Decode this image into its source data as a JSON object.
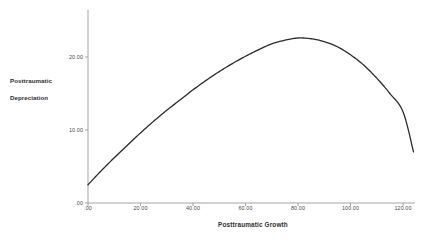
{
  "figure": {
    "background_color": "#ffffff",
    "axis_color": "#9b9b9b",
    "curve_color": "#2b2b2b",
    "text_color": "#3a3a3a"
  },
  "axes": {
    "y_title_line1": "Posttraumatic",
    "y_title_line2": "Depreciation",
    "x_title": "Posttraumatic Growth",
    "x_tick_labels": [
      ".00",
      "20.00",
      "40.00",
      "60.00",
      "80.00",
      "100.00",
      "120.00"
    ],
    "y_tick_labels": [
      ".00",
      "10.00",
      "20.00"
    ]
  },
  "chart_data": {
    "type": "line",
    "title": "",
    "subtitle": "",
    "xlabel": "Posttraumatic Growth",
    "ylabel": "Posttraumatic Depreciation",
    "xlim": [
      0,
      125
    ],
    "ylim": [
      0,
      27.8
    ],
    "xticks": [
      0,
      20,
      40,
      60,
      80,
      100,
      120
    ],
    "yticks": [
      0,
      10,
      20
    ],
    "xtick_labels": [
      ".00",
      "20.00",
      "40.00",
      "60.00",
      "80.00",
      "100.00",
      "120.00"
    ],
    "ytick_labels": [
      ".00",
      "10.00",
      "20.00"
    ],
    "grid": false,
    "legend": false,
    "legend_position": "none",
    "series": [
      {
        "name": "Posttraumatic Depreciation",
        "shape": "inverted-quadratic",
        "color": "#2b2b2b",
        "line_width": 1.3,
        "x": [
          0,
          5,
          10,
          15,
          20,
          25,
          30,
          35,
          40,
          45,
          50,
          55,
          60,
          65,
          70,
          75,
          80,
          85,
          90,
          95,
          100,
          105,
          110,
          115,
          120,
          124
        ],
        "y": [
          2.5,
          4.4,
          6.2,
          7.9,
          9.6,
          11.2,
          12.7,
          14.1,
          15.5,
          16.8,
          18.0,
          19.1,
          20.1,
          21.0,
          21.8,
          22.3,
          22.6,
          22.5,
          22.1,
          21.4,
          20.3,
          18.9,
          17.1,
          15.0,
          12.5,
          7.0
        ]
      }
    ],
    "annotations": [
      {
        "text": "vertex",
        "x": 78,
        "y": 22.6,
        "visible": false
      }
    ]
  }
}
